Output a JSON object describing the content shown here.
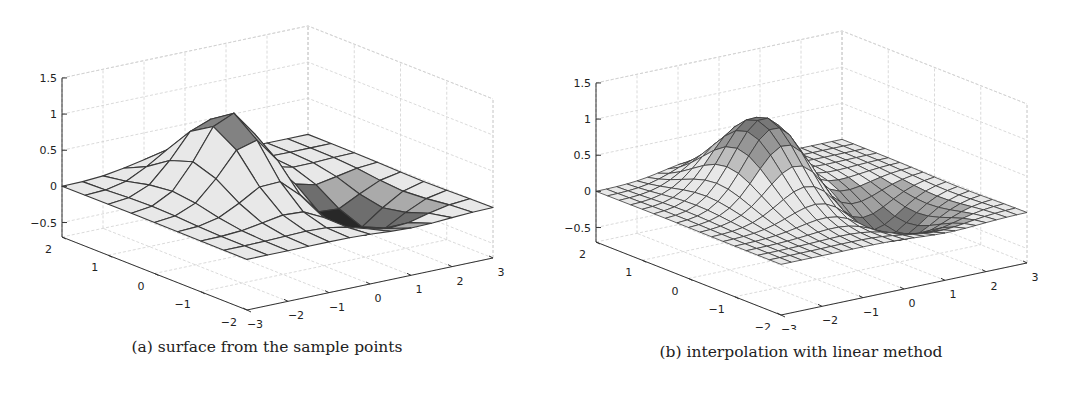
{
  "figure": {
    "panels": [
      {
        "id": "a",
        "caption": "(a) surface from the sample points"
      },
      {
        "id": "b",
        "caption": "(b) interpolation with linear method"
      }
    ]
  },
  "chart_data": [
    {
      "type": "surface",
      "title": "(a) surface from the sample points",
      "xlabel": "",
      "ylabel": "",
      "zlabel": "",
      "xlim": [
        -3,
        3
      ],
      "ylim": [
        -2,
        2
      ],
      "zlim": [
        -0.7,
        1.5
      ],
      "x_ticks": [
        -3,
        -2,
        -1,
        0,
        1,
        2,
        3
      ],
      "y_ticks": [
        -2,
        -1,
        0,
        1,
        2
      ],
      "z_ticks": [
        -0.5,
        0,
        0.5,
        1,
        1.5
      ],
      "x_tick_labels": [
        "−3",
        "−2",
        "−1",
        "0",
        "1",
        "2",
        "3"
      ],
      "y_tick_labels": [
        "−2",
        "−1",
        "0",
        "1",
        "2"
      ],
      "z_tick_labels": [
        "−0.5",
        "0",
        "0.5",
        "1",
        "1.5"
      ],
      "grid": true,
      "mesh": {
        "nx": 13,
        "ny": 9,
        "step": 0.5
      },
      "surface_features": {
        "peak_z": 1.1,
        "peak_xy": [
          -0.5,
          0.5
        ],
        "trough_z": -0.5,
        "trough_xy": [
          1.0,
          -0.5
        ]
      },
      "colormap": "gray"
    },
    {
      "type": "surface",
      "title": "(b) interpolation with linear method",
      "xlabel": "",
      "ylabel": "",
      "zlabel": "",
      "xlim": [
        -3,
        3
      ],
      "ylim": [
        -2,
        2
      ],
      "zlim": [
        -0.7,
        1.5
      ],
      "x_ticks": [
        -3,
        -2,
        -1,
        0,
        1,
        2,
        3
      ],
      "y_ticks": [
        -2,
        -1,
        0,
        1,
        2
      ],
      "z_ticks": [
        -0.5,
        0,
        0.5,
        1,
        1.5
      ],
      "x_tick_labels": [
        "−3",
        "−2",
        "−1",
        "0",
        "1",
        "2",
        "3"
      ],
      "y_tick_labels": [
        "−2",
        "−1",
        "0",
        "1",
        "2"
      ],
      "z_tick_labels": [
        "−0.5",
        "0",
        "0.5",
        "1",
        "1.5"
      ],
      "grid": true,
      "mesh": {
        "nx": 25,
        "ny": 17,
        "step": 0.25
      },
      "surface_features": {
        "peak_z": 1.1,
        "peak_xy": [
          -0.5,
          0.5
        ],
        "trough_z": -0.5,
        "trough_xy": [
          1.0,
          -0.5
        ]
      },
      "colormap": "gray"
    }
  ]
}
